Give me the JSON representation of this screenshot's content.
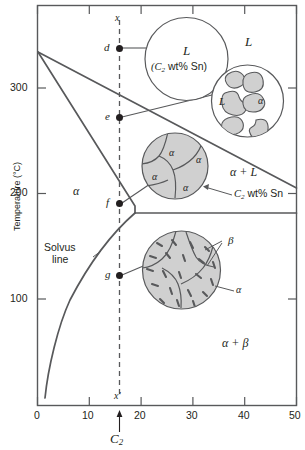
{
  "figure": {
    "kind": "binary-eutectic-phase-diagram",
    "axes": {
      "ylabel": "Temperature (°C)",
      "yticks": [
        100,
        200,
        300
      ],
      "ytick_labels": [
        "100",
        "200",
        "300"
      ],
      "ylim": [
        0,
        350
      ],
      "xticks": [
        0,
        10,
        20,
        30,
        40,
        50
      ],
      "xtick_labels": [
        "0",
        "10",
        "20",
        "30",
        "40",
        "50"
      ],
      "xlim": [
        0,
        50
      ],
      "xlabel": "C",
      "xlabel_sub": "2"
    },
    "region_labels": [
      {
        "name": "liquid-region-label",
        "text": "L"
      },
      {
        "name": "alpha-region-label",
        "text": "α"
      },
      {
        "name": "alpha-plus-liquid-region-label",
        "text": "α + L"
      },
      {
        "name": "alpha-plus-beta-region-label",
        "text": "α + β"
      }
    ],
    "annotations": {
      "solvus_line_1": "Solvus",
      "solvus_line_2": "line",
      "composition_callout": "C",
      "composition_callout_sub": "2",
      "composition_callout_tail": " wt% Sn",
      "vertical_top": "x",
      "vertical_bottom": "x'"
    },
    "points": [
      {
        "name": "point-d",
        "label": "d",
        "composition": 15,
        "temperature": 330
      },
      {
        "name": "point-e",
        "label": "e",
        "composition": 15,
        "temperature": 265
      },
      {
        "name": "point-f",
        "label": "f",
        "composition": 15,
        "temperature": 193
      },
      {
        "name": "point-g",
        "label": "g",
        "composition": 15,
        "temperature": 125
      }
    ],
    "microstructures": [
      {
        "name": "microstructure-liquid",
        "line1": "L",
        "line2_prefix": "(C",
        "line2_sub": "2",
        "line2_tail": " wt% Sn)",
        "at_point": "d"
      },
      {
        "name": "microstructure-liquid-plus-alpha",
        "liquid_label": "L",
        "alpha_label": "α",
        "at_point": "e"
      },
      {
        "name": "microstructure-alpha-grains",
        "grain_labels": [
          "α",
          "α",
          "α",
          "α"
        ],
        "at_point": "f"
      },
      {
        "name": "microstructure-alpha-plus-beta",
        "beta_label": "β",
        "alpha_label": "α",
        "at_point": "g"
      }
    ],
    "colors": {
      "line": "#58595b",
      "text": "#231f20",
      "grain_fill": "#d0d0d0",
      "background": "#ffffff"
    }
  }
}
